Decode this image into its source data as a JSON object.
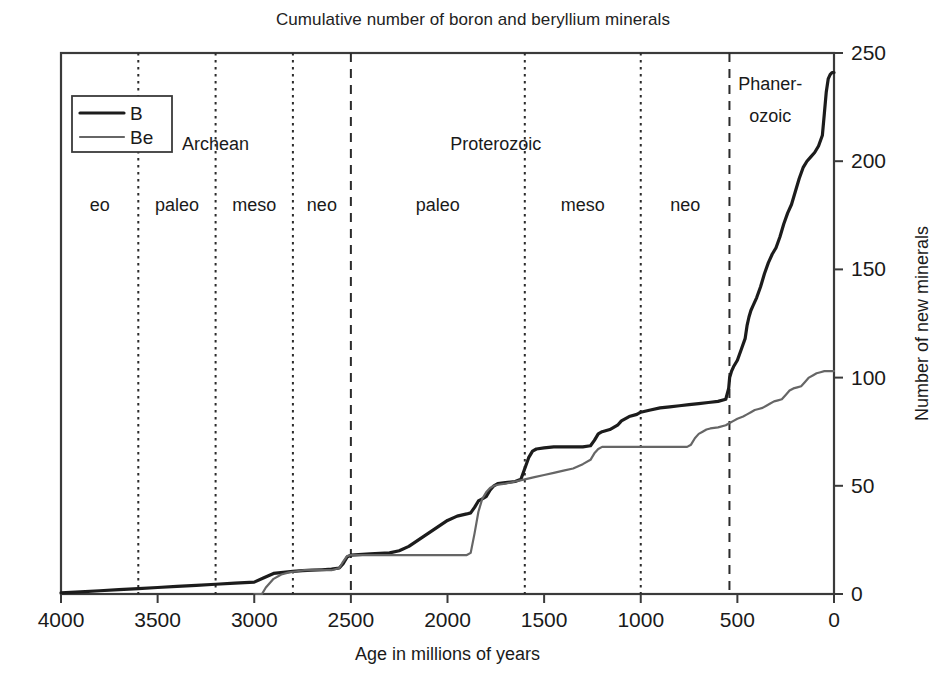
{
  "chart_data": {
    "type": "line",
    "title": "Cumulative number of boron and beryllium minerals",
    "xlabel": "Age in millions of years",
    "ylabel": "Number of new minerals",
    "xlim": [
      4000,
      0
    ],
    "ylim": [
      0,
      250
    ],
    "x_ticks": [
      4000,
      3500,
      3000,
      2500,
      2000,
      1500,
      1000,
      500,
      0
    ],
    "y_ticks": [
      0,
      50,
      100,
      150,
      200,
      250
    ],
    "x_axis_reversed": true,
    "grid": false,
    "legend_position": "top-left",
    "legend": [
      "B",
      "Be"
    ],
    "series": [
      {
        "name": "B",
        "color": "#1c1c1c",
        "width": 3.2,
        "style": "solid",
        "points": [
          [
            4000,
            0.5
          ],
          [
            3900,
            1
          ],
          [
            3800,
            1.5
          ],
          [
            3700,
            2
          ],
          [
            3600,
            2.5
          ],
          [
            3500,
            3
          ],
          [
            3400,
            3.5
          ],
          [
            3300,
            4
          ],
          [
            3200,
            4.5
          ],
          [
            3100,
            5
          ],
          [
            3000,
            5.5
          ],
          [
            2950,
            7.5
          ],
          [
            2900,
            9.5
          ],
          [
            2850,
            10
          ],
          [
            2800,
            10.5
          ],
          [
            2750,
            10.8
          ],
          [
            2700,
            11
          ],
          [
            2650,
            11.2
          ],
          [
            2600,
            11.5
          ],
          [
            2560,
            12
          ],
          [
            2540,
            14
          ],
          [
            2520,
            17
          ],
          [
            2500,
            18
          ],
          [
            2460,
            18.2
          ],
          [
            2400,
            18.5
          ],
          [
            2350,
            18.8
          ],
          [
            2300,
            19
          ],
          [
            2250,
            20
          ],
          [
            2200,
            22
          ],
          [
            2150,
            25
          ],
          [
            2100,
            28
          ],
          [
            2050,
            31
          ],
          [
            2000,
            34
          ],
          [
            1950,
            36
          ],
          [
            1900,
            37
          ],
          [
            1880,
            37.5
          ],
          [
            1860,
            40
          ],
          [
            1840,
            43
          ],
          [
            1820,
            44
          ],
          [
            1800,
            45
          ],
          [
            1780,
            48
          ],
          [
            1760,
            50
          ],
          [
            1740,
            51
          ],
          [
            1700,
            51.5
          ],
          [
            1650,
            52
          ],
          [
            1620,
            53
          ],
          [
            1600,
            58
          ],
          [
            1580,
            63
          ],
          [
            1560,
            66
          ],
          [
            1540,
            67
          ],
          [
            1500,
            67.5
          ],
          [
            1450,
            68
          ],
          [
            1400,
            68
          ],
          [
            1350,
            68
          ],
          [
            1300,
            68
          ],
          [
            1260,
            68.5
          ],
          [
            1240,
            71
          ],
          [
            1220,
            74
          ],
          [
            1200,
            75
          ],
          [
            1160,
            76
          ],
          [
            1120,
            78
          ],
          [
            1100,
            80
          ],
          [
            1060,
            82
          ],
          [
            1020,
            83
          ],
          [
            1000,
            84
          ],
          [
            950,
            85
          ],
          [
            900,
            86
          ],
          [
            850,
            86.5
          ],
          [
            800,
            87
          ],
          [
            750,
            87.5
          ],
          [
            700,
            88
          ],
          [
            650,
            88.5
          ],
          [
            600,
            89
          ],
          [
            560,
            90
          ],
          [
            545,
            95
          ],
          [
            540,
            100
          ],
          [
            530,
            103
          ],
          [
            520,
            105
          ],
          [
            500,
            108
          ],
          [
            480,
            113
          ],
          [
            460,
            118
          ],
          [
            450,
            124
          ],
          [
            440,
            128
          ],
          [
            430,
            131
          ],
          [
            420,
            133
          ],
          [
            400,
            137
          ],
          [
            380,
            142
          ],
          [
            360,
            148
          ],
          [
            340,
            153
          ],
          [
            320,
            157
          ],
          [
            300,
            160
          ],
          [
            280,
            165
          ],
          [
            260,
            171
          ],
          [
            240,
            176
          ],
          [
            220,
            180
          ],
          [
            200,
            186
          ],
          [
            180,
            192
          ],
          [
            160,
            197
          ],
          [
            140,
            200
          ],
          [
            120,
            202
          ],
          [
            100,
            204
          ],
          [
            80,
            207
          ],
          [
            60,
            212
          ],
          [
            50,
            222
          ],
          [
            40,
            232
          ],
          [
            30,
            238
          ],
          [
            20,
            240
          ],
          [
            10,
            241
          ],
          [
            0,
            241
          ]
        ]
      },
      {
        "name": "Be",
        "color": "#666666",
        "width": 2.2,
        "style": "solid",
        "points": [
          [
            3000,
            0
          ],
          [
            2960,
            0
          ],
          [
            2940,
            3
          ],
          [
            2900,
            7
          ],
          [
            2860,
            9
          ],
          [
            2820,
            10
          ],
          [
            2780,
            10.5
          ],
          [
            2740,
            11
          ],
          [
            2700,
            11
          ],
          [
            2650,
            11
          ],
          [
            2600,
            11
          ],
          [
            2560,
            12
          ],
          [
            2540,
            15
          ],
          [
            2520,
            17.5
          ],
          [
            2500,
            18
          ],
          [
            2450,
            18
          ],
          [
            2400,
            18
          ],
          [
            2350,
            18
          ],
          [
            2300,
            18
          ],
          [
            2250,
            18
          ],
          [
            2200,
            18
          ],
          [
            2150,
            18
          ],
          [
            2100,
            18
          ],
          [
            2050,
            18
          ],
          [
            2000,
            18
          ],
          [
            1950,
            18
          ],
          [
            1900,
            18
          ],
          [
            1880,
            19
          ],
          [
            1860,
            28
          ],
          [
            1840,
            38
          ],
          [
            1820,
            44
          ],
          [
            1800,
            47
          ],
          [
            1780,
            49
          ],
          [
            1760,
            50
          ],
          [
            1740,
            50.5
          ],
          [
            1700,
            51
          ],
          [
            1650,
            52
          ],
          [
            1600,
            53
          ],
          [
            1550,
            54
          ],
          [
            1500,
            55
          ],
          [
            1450,
            56
          ],
          [
            1400,
            57
          ],
          [
            1350,
            58
          ],
          [
            1300,
            60
          ],
          [
            1260,
            62
          ],
          [
            1240,
            65
          ],
          [
            1220,
            67
          ],
          [
            1200,
            68
          ],
          [
            1160,
            68
          ],
          [
            1120,
            68
          ],
          [
            1080,
            68
          ],
          [
            1040,
            68
          ],
          [
            1020,
            68
          ],
          [
            1000,
            68
          ],
          [
            950,
            68
          ],
          [
            900,
            68
          ],
          [
            850,
            68
          ],
          [
            800,
            68
          ],
          [
            760,
            68
          ],
          [
            740,
            69
          ],
          [
            720,
            72
          ],
          [
            700,
            74
          ],
          [
            680,
            75
          ],
          [
            660,
            76
          ],
          [
            640,
            76.5
          ],
          [
            600,
            77
          ],
          [
            560,
            78
          ],
          [
            540,
            79
          ],
          [
            520,
            80
          ],
          [
            500,
            81
          ],
          [
            470,
            82
          ],
          [
            450,
            83
          ],
          [
            430,
            84
          ],
          [
            410,
            85
          ],
          [
            390,
            85.5
          ],
          [
            370,
            86
          ],
          [
            350,
            87
          ],
          [
            330,
            88
          ],
          [
            310,
            89
          ],
          [
            290,
            89.5
          ],
          [
            270,
            90
          ],
          [
            250,
            92
          ],
          [
            230,
            94
          ],
          [
            210,
            95
          ],
          [
            190,
            95.5
          ],
          [
            170,
            96
          ],
          [
            150,
            98
          ],
          [
            130,
            100
          ],
          [
            110,
            101
          ],
          [
            90,
            102
          ],
          [
            70,
            102.5
          ],
          [
            50,
            103
          ],
          [
            30,
            103
          ],
          [
            10,
            103
          ],
          [
            0,
            103
          ]
        ]
      }
    ],
    "era_dividers": [
      {
        "age": 3600,
        "style": "dotted"
      },
      {
        "age": 3200,
        "style": "dotted"
      },
      {
        "age": 2800,
        "style": "dotted"
      },
      {
        "age": 2500,
        "style": "dashed"
      },
      {
        "age": 1600,
        "style": "dotted"
      },
      {
        "age": 1000,
        "style": "dotted"
      },
      {
        "age": 541,
        "style": "dashed"
      }
    ],
    "eon_labels": [
      {
        "label": "Archean",
        "age": 3200,
        "y_value": 205
      },
      {
        "label": "Proterozoic",
        "age": 1750,
        "y_value": 205
      },
      {
        "label": "Phaner-",
        "age": 330,
        "y_value": 233
      },
      {
        "label": "ozoic",
        "age": 330,
        "y_value": 218
      }
    ],
    "era_labels": [
      {
        "label": "eo",
        "age": 3800
      },
      {
        "label": "paleo",
        "age": 3400
      },
      {
        "label": "meso",
        "age": 3000
      },
      {
        "label": "neo",
        "age": 2650
      },
      {
        "label": "paleo",
        "age": 2050
      },
      {
        "label": "meso",
        "age": 1300
      },
      {
        "label": "neo",
        "age": 770
      }
    ],
    "era_label_y_value": 177
  }
}
